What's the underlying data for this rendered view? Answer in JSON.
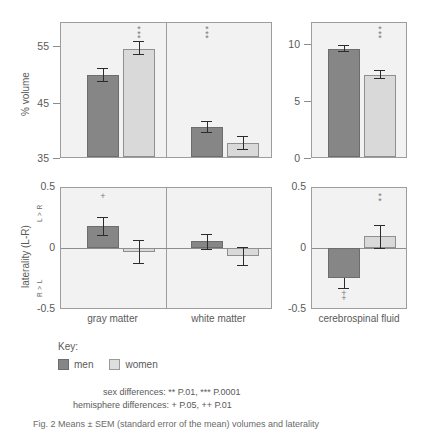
{
  "figure": {
    "caption": "Fig. 2  Means ± SEM (standard error of the mean) volumes and laterality",
    "key": {
      "title": "Key:",
      "men_label": "men",
      "women_label": "women",
      "men_color": "#868686",
      "women_color": "#d9d9d9"
    },
    "notes": {
      "sex": "sex differences:  ** P.01,  *** P.0001",
      "hemisphere": "hemisphere differences:  + P.05,  ++ P.01"
    }
  },
  "chart_data": [
    {
      "id": "volume-tissue",
      "type": "bar",
      "title": "",
      "ylabel": "% volume",
      "ylim": [
        35,
        58
      ],
      "yticks": [
        35,
        45,
        55
      ],
      "grid": false,
      "legend": [
        "men",
        "women"
      ],
      "categories": [
        "gray matter",
        "white matter"
      ],
      "series": [
        {
          "name": "men",
          "values": [
            50.5,
            40.0
          ],
          "errors": [
            0.55,
            0.45
          ]
        },
        {
          "name": "women",
          "values": [
            55.0,
            37.3
          ],
          "errors": [
            0.55,
            0.6
          ]
        }
      ],
      "annotations": [
        {
          "category": "gray matter",
          "text": "***",
          "position": "above"
        },
        {
          "category": "white matter",
          "text": "***",
          "position": "above"
        }
      ]
    },
    {
      "id": "volume-csf",
      "type": "bar",
      "title": "",
      "ylabel": "% volume",
      "ylim": [
        0,
        11.6
      ],
      "yticks": [
        0,
        5,
        10
      ],
      "grid": false,
      "legend": [
        "men",
        "women"
      ],
      "categories": [
        "cerebrospinal fluid"
      ],
      "series": [
        {
          "name": "men",
          "values": [
            9.2
          ],
          "errors": [
            0.28
          ]
        },
        {
          "name": "women",
          "values": [
            7.0
          ],
          "errors": [
            0.35
          ]
        }
      ],
      "annotations": [
        {
          "category": "cerebrospinal fluid",
          "text": "***",
          "position": "above"
        }
      ]
    },
    {
      "id": "laterality-tissue",
      "type": "bar",
      "title": "",
      "ylabel": "laterality (L-R)",
      "ylabel_top": "L > R",
      "ylabel_bottom": "R > L",
      "ylim": [
        -0.5,
        0.5
      ],
      "yticks": [
        -0.5,
        0,
        0.5
      ],
      "grid": false,
      "legend": [
        "men",
        "women"
      ],
      "categories": [
        "gray matter",
        "white matter"
      ],
      "series": [
        {
          "name": "men",
          "values": [
            0.19,
            0.055
          ],
          "errors": [
            0.075,
            0.065
          ]
        },
        {
          "name": "women",
          "values": [
            -0.03,
            -0.07
          ],
          "errors": [
            0.1,
            0.075
          ]
        }
      ],
      "annotations": [
        {
          "category": "gray matter",
          "text": "+",
          "position": "above"
        }
      ]
    },
    {
      "id": "laterality-csf",
      "type": "bar",
      "title": "",
      "ylabel": "laterality (L-R)",
      "ylim": [
        -0.5,
        0.5
      ],
      "yticks": [
        -0.5,
        0,
        0.5
      ],
      "grid": false,
      "legend": [
        "men",
        "women"
      ],
      "categories": [
        "cerebrospinal fluid"
      ],
      "series": [
        {
          "name": "men",
          "values": [
            -0.25
          ],
          "errors": [
            0.085
          ]
        },
        {
          "name": "women",
          "values": [
            0.1
          ],
          "errors": [
            0.09
          ]
        }
      ],
      "annotations": [
        {
          "category": "cerebrospinal fluid",
          "text": "**",
          "position": "above"
        },
        {
          "category": "cerebrospinal fluid",
          "text": "++",
          "position": "below"
        }
      ]
    }
  ],
  "axes": {
    "volume_ticks": [
      "55",
      "45",
      "35"
    ],
    "csf_volume_ticks": [
      "10",
      "5",
      "0"
    ],
    "lat_ticks": [
      "0.5",
      "0",
      "-0.5"
    ],
    "csf_lat_ticks": [
      "0.5",
      "0",
      "-0.5"
    ],
    "volume_name": "% volume",
    "lat_name": "laterality (L-R)",
    "lat_top": "L > R",
    "lat_bottom": "R > L",
    "cat_gray": "gray matter",
    "cat_white": "white matter",
    "cat_csf": "cerebrospinal fluid"
  },
  "marks": {
    "gm_vol_sig": "***",
    "wm_vol_sig": "***",
    "csf_vol_sig": "***",
    "gm_lat_sig": "+",
    "csf_lat_sig": "**",
    "csf_lat_hemi": "++"
  }
}
